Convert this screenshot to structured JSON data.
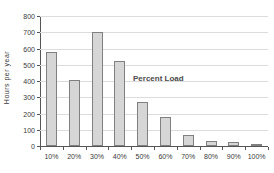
{
  "chart_data": {
    "type": "bar",
    "title": "",
    "annotation": "Percent Load",
    "ylabel": "Hours per year",
    "xlabel": "",
    "categories": [
      "10%",
      "20%",
      "30%",
      "40%",
      "50%",
      "60%",
      "70%",
      "80%",
      "90%",
      "100%"
    ],
    "values": [
      580,
      405,
      700,
      525,
      270,
      180,
      65,
      30,
      25,
      10
    ],
    "ylim": [
      0,
      800
    ],
    "yticks": [
      0,
      100,
      200,
      300,
      400,
      500,
      600,
      700,
      800
    ],
    "grid": "horizontal",
    "legend_position": "none",
    "colors": {
      "bar_fill": "#d6d6d6",
      "bar_border": "#808080",
      "gridline": "#dcdcdc",
      "axis": "#555555",
      "text": "#3a3a3a",
      "background": "#ffffff"
    }
  }
}
